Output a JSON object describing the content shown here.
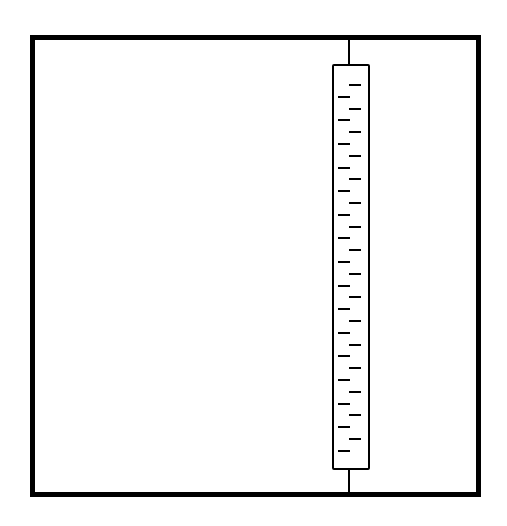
{
  "diagram": {
    "frame": {
      "x": 30,
      "y": 35,
      "width": 451,
      "height": 462,
      "stroke": "#000000"
    },
    "rod": {
      "x": 348,
      "top": 40,
      "bottom": 492
    },
    "tube": {
      "x": 332,
      "y": 64,
      "width": 38,
      "height": 406
    },
    "ticks": {
      "count": 32,
      "first_y": 84,
      "spacing": 11.8,
      "left_x": 338,
      "right_x": 349,
      "length": 12,
      "pattern": "alternating-right-left"
    }
  }
}
